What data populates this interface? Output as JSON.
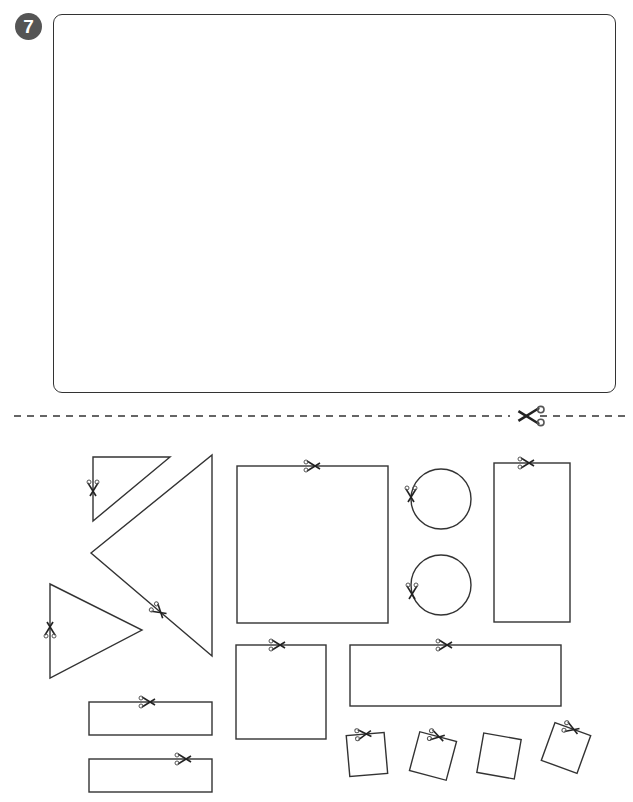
{
  "exercise": {
    "number": "7",
    "badge_color": "#555555"
  },
  "drawing_area": {
    "label": "empty drawing box",
    "border_color": "#333333"
  },
  "cut_line": {
    "style": "dashed",
    "icon": "scissors-icon",
    "color": "#333333"
  },
  "cutout_shapes": [
    {
      "type": "right-triangle",
      "size": "small"
    },
    {
      "type": "triangle",
      "size": "large"
    },
    {
      "type": "triangle",
      "size": "medium"
    },
    {
      "type": "square",
      "size": "large"
    },
    {
      "type": "circle",
      "size": "medium"
    },
    {
      "type": "circle",
      "size": "medium"
    },
    {
      "type": "rectangle",
      "size": "tall"
    },
    {
      "type": "square",
      "size": "medium"
    },
    {
      "type": "rectangle",
      "size": "wide"
    },
    {
      "type": "rectangle",
      "size": "small-wide"
    },
    {
      "type": "rectangle",
      "size": "small-wide"
    },
    {
      "type": "square",
      "size": "small"
    },
    {
      "type": "square",
      "size": "small"
    },
    {
      "type": "square",
      "size": "small"
    },
    {
      "type": "square",
      "size": "small"
    }
  ]
}
